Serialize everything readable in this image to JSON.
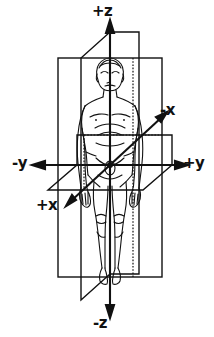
{
  "figure": {
    "ink_color": "#111111",
    "background_color": "#ffffff"
  },
  "axes": {
    "z_positive": "+z",
    "z_negative": "-z",
    "y_positive": "+y",
    "y_negative": "-y",
    "x_positive": "+x",
    "x_negative": "-x"
  },
  "planes": {
    "coronal": "coronal-frontal-plane-rectangle",
    "sagittal": "sagittal-plane-parallelogram",
    "transverse": "transverse-horizontal-plane-parallelogram"
  },
  "origin": {
    "label": "origin",
    "x": 110,
    "y": 165
  }
}
